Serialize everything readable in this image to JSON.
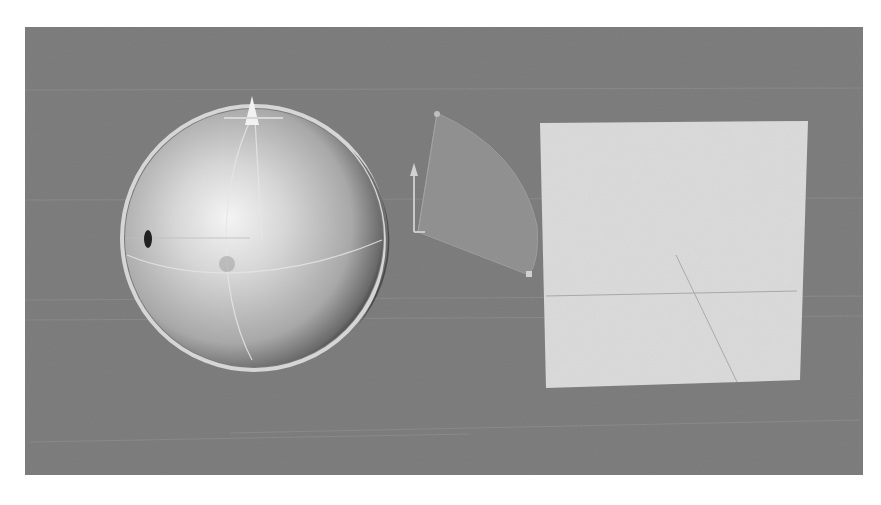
{
  "viewport": {
    "background_color": "#7b7b7b",
    "grid_line_color": "#8c8c8c"
  },
  "objects": [
    {
      "name": "sphere",
      "type": "sphere",
      "selected": true,
      "center": [
        254,
        238
      ],
      "radius": 130,
      "outline_color": "#d9d9d9",
      "highlight_color": "#f2f2f2",
      "shadow_color": "#2a2a2a"
    },
    {
      "name": "light-cone",
      "type": "sector",
      "fill_color": "#8e8e8e",
      "apex": [
        437,
        113
      ]
    },
    {
      "name": "plane",
      "type": "quad",
      "fill_color": "#d9d9d9",
      "corners": [
        [
          540,
          123
        ],
        [
          808,
          121
        ],
        [
          800,
          380
        ],
        [
          546,
          388
        ]
      ]
    }
  ],
  "caption": {
    "text": ""
  }
}
